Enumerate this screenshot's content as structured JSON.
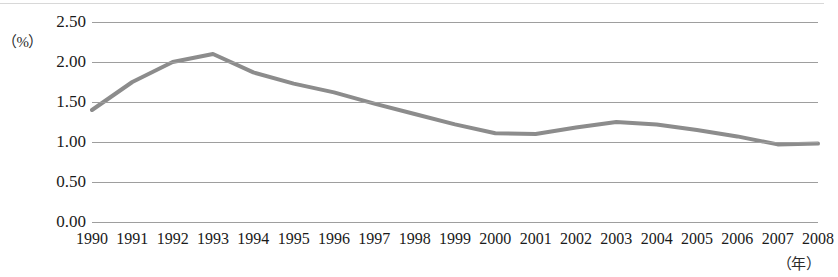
{
  "chart_data": {
    "type": "line",
    "title": "",
    "subtitle": "",
    "xlabel": "（年）",
    "ylabel": "（%）",
    "categories": [
      "1990",
      "1991",
      "1992",
      "1993",
      "1994",
      "1995",
      "1996",
      "1997",
      "1998",
      "1999",
      "2000",
      "2001",
      "2002",
      "2003",
      "2004",
      "2005",
      "2006",
      "2007",
      "2008"
    ],
    "values": [
      1.4,
      1.75,
      2.0,
      2.1,
      1.87,
      1.73,
      1.62,
      1.48,
      1.35,
      1.22,
      1.11,
      1.1,
      1.18,
      1.25,
      1.22,
      1.15,
      1.07,
      0.97,
      0.98
    ],
    "series": [
      {
        "name": "",
        "values": [
          1.4,
          1.75,
          2.0,
          2.1,
          1.87,
          1.73,
          1.62,
          1.48,
          1.35,
          1.22,
          1.11,
          1.1,
          1.18,
          1.25,
          1.22,
          1.15,
          1.07,
          0.97,
          0.98
        ]
      }
    ],
    "ylim": [
      0.0,
      2.5
    ],
    "ytick_labels": [
      "2.50",
      "2.00",
      "1.50",
      "1.00",
      "0.50",
      "0.00"
    ],
    "ytick_values": [
      2.5,
      2.0,
      1.5,
      1.0,
      0.5,
      0.0
    ],
    "grid": true,
    "legend": false,
    "legend_position": "none",
    "line_color": "#8c8c8c",
    "grid_color": "#9e9e9e"
  },
  "axes": {
    "y_unit_label": "（%）",
    "x_unit_label": "（年）"
  }
}
